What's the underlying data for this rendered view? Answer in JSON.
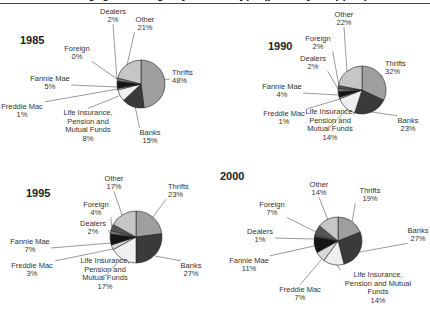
{
  "chart_data": {
    "type": "pie",
    "title": "Mortgage Holdings by Holder Type (partially cropped)",
    "colors": {
      "Thrifts": "#9e9e9e",
      "Banks": "#3a3a3a",
      "Life Insurance, Pension and Mutual Funds": "#efefef",
      "Freddie Mac": "#d8d8d8",
      "Fannie Mae": "#151515",
      "Dealers": "#7a7a7a",
      "Foreign": "#555555",
      "Other": "#c6c6c6"
    },
    "panels": [
      {
        "year": "1985",
        "cx": 141,
        "cy": 84,
        "r": 24,
        "slices": [
          {
            "name": "Thrifts",
            "value": 48,
            "label": [
              "Thrifts",
              "48%"
            ],
            "lx": 172,
            "ly": 79,
            "anchor": "start",
            "ax": 160,
            "ay": 80
          },
          {
            "name": "Banks",
            "value": 15,
            "label": [
              "Banks",
              "15%"
            ],
            "lx": 150,
            "ly": 139,
            "anchor": "middle",
            "ax": 135,
            "ay": 106
          },
          {
            "name": "Life Insurance, Pension and Mutual Funds",
            "value": 8,
            "label": [
              "Life Insurance,",
              "Pension and",
              "Mutual Funds",
              "8%"
            ],
            "lx": 88,
            "ly": 128,
            "anchor": "middle",
            "ax": 119,
            "ay": 96
          },
          {
            "name": "Freddie Mac",
            "value": 1,
            "label": [
              "Freddie Mac",
              "1%"
            ],
            "lx": 22,
            "ly": 113,
            "anchor": "middle",
            "ax": 118,
            "ay": 89
          },
          {
            "name": "Fannie Mae",
            "value": 5,
            "label": [
              "Fannie Mae",
              "5%"
            ],
            "lx": 50,
            "ly": 85,
            "anchor": "middle",
            "ax": 117,
            "ay": 87
          },
          {
            "name": "Dealers",
            "value": 2,
            "label": [
              "Dealers",
              "2%"
            ],
            "lx": 113,
            "ly": 18,
            "anchor": "middle",
            "ax": 117,
            "ay": 80
          },
          {
            "name": "Foreign",
            "value": 0,
            "label": [
              "Foreign",
              "0%"
            ],
            "lx": 77,
            "ly": 55,
            "anchor": "middle",
            "ax": 117,
            "ay": 79
          },
          {
            "name": "Other",
            "value": 21,
            "label": [
              "Other",
              "21%"
            ],
            "lx": 145,
            "ly": 26,
            "anchor": "middle",
            "ax": 127,
            "ay": 65
          }
        ]
      },
      {
        "year": "1990",
        "cx": 362,
        "cy": 90,
        "r": 24,
        "slices": [
          {
            "name": "Thrifts",
            "value": 32,
            "label": [
              "Thrifts",
              "32%"
            ],
            "lx": 385,
            "ly": 70,
            "anchor": "start",
            "ax": 380,
            "ay": 75
          },
          {
            "name": "Banks",
            "value": 23,
            "label": [
              "Banks",
              "23%"
            ],
            "lx": 408,
            "ly": 127,
            "anchor": "middle",
            "ax": 372,
            "ay": 112
          },
          {
            "name": "Life Insurance, Pension and Mutual Funds",
            "value": 14,
            "label": [
              "Life Insurance,",
              "Pension and",
              "Mutual Funds",
              "14%"
            ],
            "lx": 330,
            "ly": 127,
            "anchor": "middle",
            "ax": 347,
            "ay": 109
          },
          {
            "name": "Freddie Mac",
            "value": 1,
            "label": [
              "Freddie Mac",
              "1%"
            ],
            "lx": 284,
            "ly": 120,
            "anchor": "middle",
            "ax": 340,
            "ay": 99
          },
          {
            "name": "Fannie Mae",
            "value": 4,
            "label": [
              "Fannie Mae",
              "4%"
            ],
            "lx": 282,
            "ly": 93,
            "anchor": "middle",
            "ax": 338,
            "ay": 95
          },
          {
            "name": "Dealers",
            "value": 2,
            "label": [
              "Dealers",
              "2%"
            ],
            "lx": 313,
            "ly": 65,
            "anchor": "middle",
            "ax": 338,
            "ay": 89
          },
          {
            "name": "Foreign",
            "value": 2,
            "label": [
              "Foreign",
              "2%"
            ],
            "lx": 318,
            "ly": 45,
            "anchor": "middle",
            "ax": 339,
            "ay": 86
          },
          {
            "name": "Other",
            "value": 22,
            "label": [
              "Other",
              "22%"
            ],
            "lx": 344,
            "ly": 21,
            "anchor": "middle",
            "ax": 347,
            "ay": 72
          }
        ]
      },
      {
        "year": "1995",
        "cx": 136,
        "cy": 237,
        "r": 26,
        "slices": [
          {
            "name": "Thrifts",
            "value": 23,
            "label": [
              "Thrifts",
              "23%"
            ],
            "lx": 168,
            "ly": 193,
            "anchor": "start",
            "ax": 153,
            "ay": 217
          },
          {
            "name": "Banks",
            "value": 27,
            "label": [
              "Banks",
              "27%"
            ],
            "lx": 191,
            "ly": 272,
            "anchor": "middle",
            "ax": 155,
            "ay": 256
          },
          {
            "name": "Life Insurance, Pension and Mutual Funds",
            "value": 17,
            "label": [
              "Life Insurance,",
              "Pension and",
              "Mutual Funds",
              "17%"
            ],
            "lx": 105,
            "ly": 276,
            "anchor": "middle",
            "ax": 121,
            "ay": 259
          },
          {
            "name": "Freddie Mac",
            "value": 3,
            "label": [
              "Freddie Mac",
              "3%"
            ],
            "lx": 32,
            "ly": 272,
            "anchor": "middle",
            "ax": 113,
            "ay": 249
          },
          {
            "name": "Fannie Mae",
            "value": 7,
            "label": [
              "Fannie Mae",
              "7%"
            ],
            "lx": 30,
            "ly": 248,
            "anchor": "middle",
            "ax": 111,
            "ay": 243
          },
          {
            "name": "Dealers",
            "value": 2,
            "label": [
              "Dealers",
              "2%"
            ],
            "lx": 93,
            "ly": 230,
            "anchor": "middle",
            "ax": 111,
            "ay": 234
          },
          {
            "name": "Foreign",
            "value": 4,
            "label": [
              "Foreign",
              "4%"
            ],
            "lx": 96,
            "ly": 211,
            "anchor": "middle",
            "ax": 112,
            "ay": 228
          },
          {
            "name": "Other",
            "value": 17,
            "label": [
              "Other",
              "17%"
            ],
            "lx": 114,
            "ly": 185,
            "anchor": "middle",
            "ax": 122,
            "ay": 215
          }
        ]
      },
      {
        "year": "2000",
        "cx": 338,
        "cy": 241,
        "r": 24,
        "slices": [
          {
            "name": "Thrifts",
            "value": 19,
            "label": [
              "Thrifts",
              "19%"
            ],
            "lx": 370,
            "ly": 197,
            "anchor": "middle",
            "ax": 352,
            "ay": 222
          },
          {
            "name": "Banks",
            "value": 27,
            "label": [
              "Banks",
              "27%"
            ],
            "lx": 418,
            "ly": 237,
            "anchor": "middle",
            "ax": 360,
            "ay": 252
          },
          {
            "name": "Life Insurance, Pension and Mutual Funds",
            "value": 14,
            "label": [
              "Life Insurance,",
              "Pension and Mutual",
              "Funds",
              "14%"
            ],
            "lx": 378,
            "ly": 290,
            "anchor": "middle",
            "ax": 336,
            "ay": 263
          },
          {
            "name": "Freddie Mac",
            "value": 7,
            "label": [
              "Freddie Mac",
              "7%"
            ],
            "lx": 300,
            "ly": 296,
            "anchor": "middle",
            "ax": 322,
            "ay": 259
          },
          {
            "name": "Fannie Mae",
            "value": 11,
            "label": [
              "Fannie Mae",
              "11%"
            ],
            "lx": 249,
            "ly": 267,
            "anchor": "middle",
            "ax": 314,
            "ay": 246
          },
          {
            "name": "Dealers",
            "value": 1,
            "label": [
              "Dealers",
              "1%"
            ],
            "lx": 260,
            "ly": 238,
            "anchor": "middle",
            "ax": 314,
            "ay": 239
          },
          {
            "name": "Foreign",
            "value": 7,
            "label": [
              "Foreign",
              "7%"
            ],
            "lx": 272,
            "ly": 211,
            "anchor": "middle",
            "ax": 316,
            "ay": 232
          },
          {
            "name": "Other",
            "value": 14,
            "label": [
              "Other",
              "14%"
            ],
            "lx": 319,
            "ly": 191,
            "anchor": "middle",
            "ax": 328,
            "ay": 220
          }
        ]
      }
    ],
    "slice_order_note": "Slices drawn clockwise from 12 o'clock: Thrifts, Banks, Life Insurance/Pension/Mutual Funds, Freddie Mac, Fannie Mae, Dealers, Foreign, Other"
  }
}
